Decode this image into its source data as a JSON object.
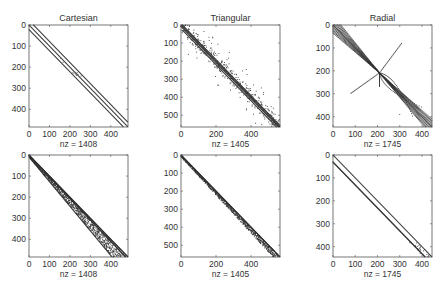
{
  "figure": {
    "columns": [
      "Cartesian",
      "Triangular",
      "Radial"
    ]
  },
  "chart_data": [
    {
      "type": "scatter",
      "subtype": "spy",
      "row": 1,
      "col": 1,
      "title": "Cartesian",
      "xlabel": "nz = 1408",
      "nz": 1408,
      "size": 484,
      "xlim": [
        0,
        484
      ],
      "ylim": [
        484,
        0
      ],
      "xticks": [
        0,
        100,
        200,
        300,
        400
      ],
      "yticks": [
        0,
        100,
        200,
        300,
        400
      ],
      "pattern": "main diagonal plus two off-diagonal bands at offsets ~ +22 and -22, few scattered entries near rows 150-260"
    },
    {
      "type": "scatter",
      "subtype": "spy",
      "row": 1,
      "col": 2,
      "title": "Triangular",
      "xlabel": "nz = 1405",
      "nz": 1405,
      "size": 565,
      "xlim": [
        0,
        565
      ],
      "ylim": [
        565,
        0
      ],
      "xticks": [
        0,
        200,
        400
      ],
      "yticks": [
        0,
        100,
        200,
        300,
        400,
        500
      ],
      "pattern": "diagonal bands with widely scattered entries around diagonal"
    },
    {
      "type": "scatter",
      "subtype": "spy",
      "row": 1,
      "col": 3,
      "title": "Radial",
      "xlabel": "nz = 1745",
      "nz": 1745,
      "size": 445,
      "xlim": [
        0,
        445
      ],
      "ylim": [
        445,
        0
      ],
      "xticks": [
        0,
        100,
        200,
        300,
        400
      ],
      "yticks": [
        0,
        100,
        200,
        300,
        400
      ],
      "pattern": "multiple diagonal bands converging at center node ~209, with curved fan entries"
    },
    {
      "type": "scatter",
      "subtype": "spy",
      "row": 2,
      "col": 1,
      "title": "",
      "xlabel": "nz = 1408",
      "nz": 1408,
      "size": 484,
      "xlim": [
        0,
        484
      ],
      "ylim": [
        484,
        0
      ],
      "xticks": [
        0,
        100,
        200,
        300,
        400
      ],
      "yticks": [
        0,
        100,
        200,
        300,
        400
      ],
      "pattern": "lower triangular band widening toward bottom-right (reordered)"
    },
    {
      "type": "scatter",
      "subtype": "spy",
      "row": 2,
      "col": 2,
      "title": "",
      "xlabel": "nz = 1405",
      "nz": 1405,
      "size": 565,
      "xlim": [
        0,
        565
      ],
      "ylim": [
        565,
        0
      ],
      "xticks": [
        0,
        200,
        400
      ],
      "yticks": [
        0,
        100,
        200,
        300,
        400,
        500
      ],
      "pattern": "narrow lower band along diagonal (reordered)"
    },
    {
      "type": "scatter",
      "subtype": "spy",
      "row": 2,
      "col": 3,
      "title": "",
      "xlabel": "nz = 1745",
      "nz": 1745,
      "size": 445,
      "xlim": [
        0,
        445
      ],
      "ylim": [
        445,
        0
      ],
      "xticks": [
        0,
        100,
        200,
        300,
        400
      ],
      "yticks": [
        0,
        100,
        200,
        300,
        400
      ],
      "pattern": "main diagonal plus one sub-diagonal band at offset ~ -30"
    }
  ]
}
